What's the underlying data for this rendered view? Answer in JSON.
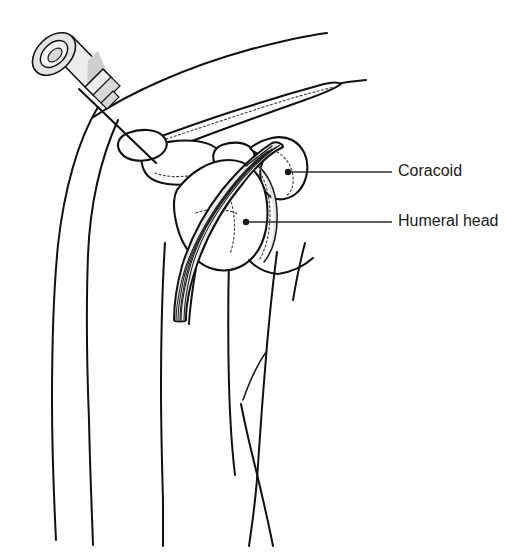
{
  "figure": {
    "background_color": "#ffffff",
    "line_color": "#111111",
    "shade_color": "#e6e6e6",
    "width": 527,
    "height": 554
  },
  "labels": [
    {
      "id": "coracoid",
      "text": "Coracoid",
      "text_x": 398,
      "text_y": 172,
      "leader_x1": 289,
      "leader_y1": 172,
      "leader_x2": 392,
      "leader_y2": 172,
      "dot_x": 288,
      "dot_y": 172,
      "dot_r": 3.2
    },
    {
      "id": "humeral-head",
      "text": "Humeral head",
      "text_x": 398,
      "text_y": 222,
      "leader_x1": 247,
      "leader_y1": 222,
      "leader_x2": 392,
      "leader_y2": 222,
      "dot_x": 246,
      "dot_y": 222,
      "dot_r": 3.2
    }
  ],
  "parts": {
    "syringe": {
      "name": "syringe",
      "plunger_label": "plunger-flange",
      "barrel_label": "barrel",
      "hub_label": "hub",
      "needle_label": "needle",
      "needle_tip_x": 156,
      "needle_tip_y": 163,
      "needle_base_x": 79,
      "needle_base_y": 89
    },
    "bones": [
      {
        "name": "clavicle"
      },
      {
        "name": "acromion"
      },
      {
        "name": "coracoid-process"
      },
      {
        "name": "humeral-head"
      },
      {
        "name": "humerus-shaft"
      }
    ],
    "soft_tissue": [
      {
        "name": "deltoid-contour"
      },
      {
        "name": "joint-capsule-band"
      },
      {
        "name": "conjoint-tendon-band"
      },
      {
        "name": "chest-wall-contour"
      },
      {
        "name": "axilla-crossing"
      }
    ]
  }
}
